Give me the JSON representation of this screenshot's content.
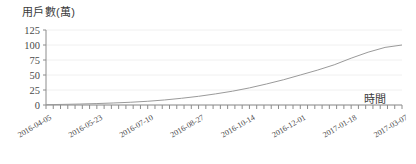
{
  "chart_data": {
    "type": "line",
    "title": "",
    "ylabel": "用戶數(萬)",
    "xlabel": "時間",
    "ylim": [
      0,
      125
    ],
    "yticks": [
      0,
      25,
      50,
      75,
      100,
      125
    ],
    "ytick_labels": [
      "0",
      "25",
      "50",
      "75",
      "100",
      "125"
    ],
    "grid": true,
    "legend": "none",
    "xtick_labels": [
      "2016-04-05",
      "2016-05-23",
      "2016-07-10",
      "2016-08-27",
      "2016-10-14",
      "2016-12-01",
      "2017-01-18",
      "2017-03-07"
    ],
    "line_color": "#9a9a9a",
    "grid_color": "#f0f0f0",
    "axis_color": "#8c8c8c",
    "x": [
      "2016-04-05",
      "2016-04-19",
      "2016-05-03",
      "2016-05-23",
      "2016-06-06",
      "2016-06-20",
      "2016-07-10",
      "2016-07-24",
      "2016-08-07",
      "2016-08-27",
      "2016-09-10",
      "2016-09-24",
      "2016-10-14",
      "2016-10-28",
      "2016-11-11",
      "2016-12-01",
      "2016-12-15",
      "2016-12-29",
      "2017-01-18",
      "2017-02-01",
      "2017-02-15",
      "2017-03-07"
    ],
    "values": [
      0.5,
      1.0,
      1.6,
      2.4,
      3.4,
      4.6,
      6.2,
      8.4,
      11.2,
      14.5,
      18.5,
      23.0,
      28.5,
      35.0,
      42.0,
      50.0,
      58.0,
      67.0,
      78.0,
      88.0,
      96.0,
      100.0
    ],
    "series_name": "用戶數"
  }
}
